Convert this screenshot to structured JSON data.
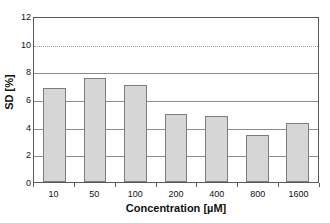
{
  "chart_data": {
    "type": "bar",
    "title": "",
    "xlabel": "Concentration [µM]",
    "ylabel": "SD [%]",
    "categories": [
      "10",
      "50",
      "100",
      "200",
      "400",
      "800",
      "1600"
    ],
    "values": [
      6.8,
      7.5,
      7.0,
      4.9,
      4.8,
      3.4,
      4.25
    ],
    "ylim": [
      0,
      12
    ],
    "ytick_labels": [
      "0",
      "2",
      "4",
      "6",
      "8",
      "10",
      "12"
    ],
    "ytick_values": [
      0,
      2,
      4,
      6,
      8,
      10,
      12
    ],
    "grid": "horizontal",
    "gridline_values": [
      2,
      4,
      6,
      8,
      10
    ],
    "dotted_gridline_values": [
      10
    ],
    "legend": "none",
    "bar_fill_color": "#d6d6d6",
    "bar_border_color": "#7d7d7d",
    "gridline_color": "#8c8c8c",
    "axis_color": "#595959",
    "text_color": "#111111",
    "background_color": "#ffffff"
  }
}
